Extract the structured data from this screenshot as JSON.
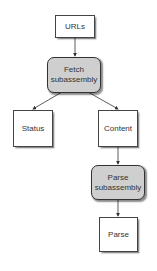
{
  "diagram": {
    "nodes": [
      {
        "id": "urls",
        "label": "URLs",
        "type": "data"
      },
      {
        "id": "fetch",
        "label": "Fetch subassembly",
        "type": "subassembly"
      },
      {
        "id": "status",
        "label": "Status",
        "type": "data"
      },
      {
        "id": "content",
        "label": "Content",
        "type": "data"
      },
      {
        "id": "parse_sub",
        "label": "Parse subassembly",
        "type": "subassembly"
      },
      {
        "id": "parse",
        "label": "Parse",
        "type": "data"
      }
    ],
    "edges": [
      {
        "from": "urls",
        "to": "fetch"
      },
      {
        "from": "fetch",
        "to": "status"
      },
      {
        "from": "fetch",
        "to": "content"
      },
      {
        "from": "content",
        "to": "parse_sub"
      },
      {
        "from": "parse_sub",
        "to": "parse"
      }
    ],
    "colors": {
      "subassembly_fill": "#cfcfcf",
      "box_fill": "#ffffff",
      "stroke": "#333333"
    }
  }
}
